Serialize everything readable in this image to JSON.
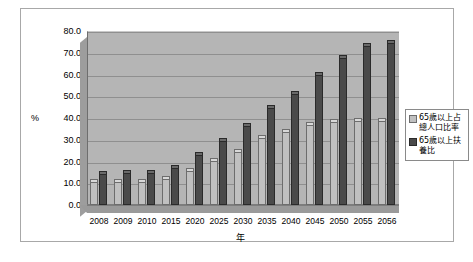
{
  "chart_data": {
    "type": "bar",
    "title": "",
    "xlabel": "年",
    "ylabel": "%",
    "ylim": [
      0.0,
      80.0
    ],
    "ytick_step": 10.0,
    "ytick_labels": [
      "80.0",
      "70.0",
      "60.0",
      "50.0",
      "40.0",
      "30.0",
      "20.0",
      "10.0",
      "0.0"
    ],
    "grid": true,
    "legend_position": "right",
    "categories": [
      "2008",
      "2009",
      "2010",
      "2015",
      "2020",
      "2025",
      "2030",
      "2035",
      "2040",
      "2045",
      "2050",
      "2055",
      "2056"
    ],
    "series": [
      {
        "name": "65歲以上占總人口比率",
        "color": "#c0c0c0",
        "values": [
          10.4,
          10.6,
          10.7,
          12.1,
          15.7,
          20.1,
          24.4,
          30.9,
          33.5,
          36.9,
          38.0,
          38.5,
          38.6
        ]
      },
      {
        "name": "65歲以上扶養比",
        "color": "#4a4a4a",
        "values": [
          14.4,
          14.6,
          14.9,
          16.9,
          22.9,
          29.6,
          36.1,
          44.4,
          51.2,
          59.7,
          67.4,
          73.2,
          74.4
        ]
      }
    ]
  },
  "legend": {
    "entries": [
      {
        "label": "65歲以上占總人口比率"
      },
      {
        "label": "65歲以上扶養比"
      }
    ]
  },
  "axis": {
    "y_unit": "%",
    "x_title": "年"
  },
  "colors": {
    "series1": "#c0c0c0",
    "series2": "#4a4a4a",
    "plot_background": "#b5b5b5",
    "gridline": "#8f8f8f",
    "frame": "#a8a8a8"
  }
}
